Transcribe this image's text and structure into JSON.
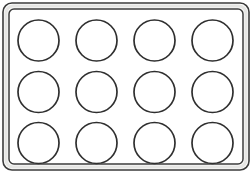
{
  "figure": {
    "background_color": "#ffffff",
    "line_color": "#2f2f2f",
    "rim_gap_color": "#e6e6e4",
    "fill_color": "#ffffff",
    "canvas": {
      "width": 252,
      "height": 173
    }
  },
  "tray": {
    "name": "tray-body",
    "outer": {
      "x": 3,
      "y": 3,
      "width": 246,
      "height": 167,
      "rx": 9,
      "ry": 9
    },
    "inner": {
      "x": 9,
      "y": 9,
      "width": 234,
      "height": 155,
      "rx": 5,
      "ry": 5
    },
    "rim_band": {
      "x": 6,
      "y": 6,
      "width": 240,
      "height": 161,
      "rx": 7,
      "ry": 7
    }
  },
  "grid": {
    "name": "cup-grid",
    "rows": 3,
    "columns": 4,
    "count": 12,
    "cup_radius": 20.5,
    "column_centers": [
      38.5,
      96.5,
      154.5,
      212.5
    ],
    "row_centers": [
      40.5,
      92.0,
      143.0
    ]
  },
  "cups": [
    {
      "id": "cup-r1c1",
      "row": 1,
      "column": 1,
      "cx": 38.5,
      "cy": 40.5,
      "r": 20.5
    },
    {
      "id": "cup-r1c2",
      "row": 1,
      "column": 2,
      "cx": 96.5,
      "cy": 40.5,
      "r": 20.5
    },
    {
      "id": "cup-r1c3",
      "row": 1,
      "column": 3,
      "cx": 154.5,
      "cy": 40.5,
      "r": 20.5
    },
    {
      "id": "cup-r1c4",
      "row": 1,
      "column": 4,
      "cx": 212.5,
      "cy": 40.5,
      "r": 20.5
    },
    {
      "id": "cup-r2c1",
      "row": 2,
      "column": 1,
      "cx": 38.5,
      "cy": 92.0,
      "r": 20.5
    },
    {
      "id": "cup-r2c2",
      "row": 2,
      "column": 2,
      "cx": 96.5,
      "cy": 92.0,
      "r": 20.5
    },
    {
      "id": "cup-r2c3",
      "row": 2,
      "column": 3,
      "cx": 154.5,
      "cy": 92.0,
      "r": 20.5
    },
    {
      "id": "cup-r2c4",
      "row": 2,
      "column": 4,
      "cx": 212.5,
      "cy": 92.0,
      "r": 20.5
    },
    {
      "id": "cup-r3c1",
      "row": 3,
      "column": 1,
      "cx": 38.5,
      "cy": 143.0,
      "r": 20.5
    },
    {
      "id": "cup-r3c2",
      "row": 3,
      "column": 2,
      "cx": 96.5,
      "cy": 143.0,
      "r": 20.5
    },
    {
      "id": "cup-r3c3",
      "row": 3,
      "column": 3,
      "cx": 154.5,
      "cy": 143.0,
      "r": 20.5
    },
    {
      "id": "cup-r3c4",
      "row": 3,
      "column": 4,
      "cx": 212.5,
      "cy": 143.0,
      "r": 20.5
    }
  ]
}
